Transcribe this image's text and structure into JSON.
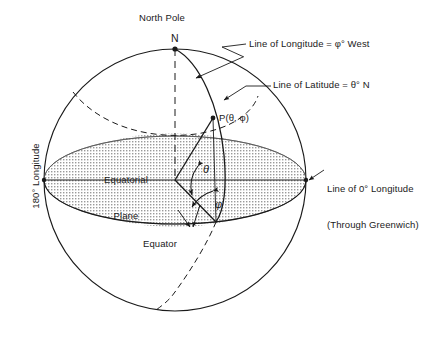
{
  "figure": {
    "title_text": "Spherical coordinate diagram of the Earth",
    "colors": {
      "stroke": "#1a1a1a",
      "shade_fill": "#d9d9d9",
      "background": "#ffffff"
    }
  },
  "labels": {
    "north_pole": "North Pole",
    "pole_marker": "N",
    "line_of_longitude": "Line of Longitude = φ° West",
    "line_of_latitude": "Line of Latitude = θ° N",
    "line_of_zero_longitude_1": "Line of 0° Longitude",
    "line_of_zero_longitude_2": "(Through Greenwich)",
    "point": "P(θ, φ)",
    "equatorial_plane_1": "Equatorial",
    "equatorial_plane_2": "Plane",
    "equator": "Equator",
    "longitude_180": "180° Longitude",
    "angle_theta": "θ",
    "angle_phi": "φ"
  },
  "geometry": {
    "sphere": {
      "cx": 175,
      "cy": 180,
      "r": 131
    },
    "equator_ellipse": {
      "cx": 175,
      "cy": 180,
      "rx": 131,
      "ry": 44
    },
    "north_pole_point": {
      "x": 175,
      "y": 49
    },
    "point_p": {
      "x": 213,
      "y": 118
    },
    "equator_foot": {
      "x": 216,
      "y": 222
    },
    "greenwich_point": {
      "x": 306,
      "y": 180
    },
    "antimeridian_point": {
      "x": 44,
      "y": 180
    }
  }
}
